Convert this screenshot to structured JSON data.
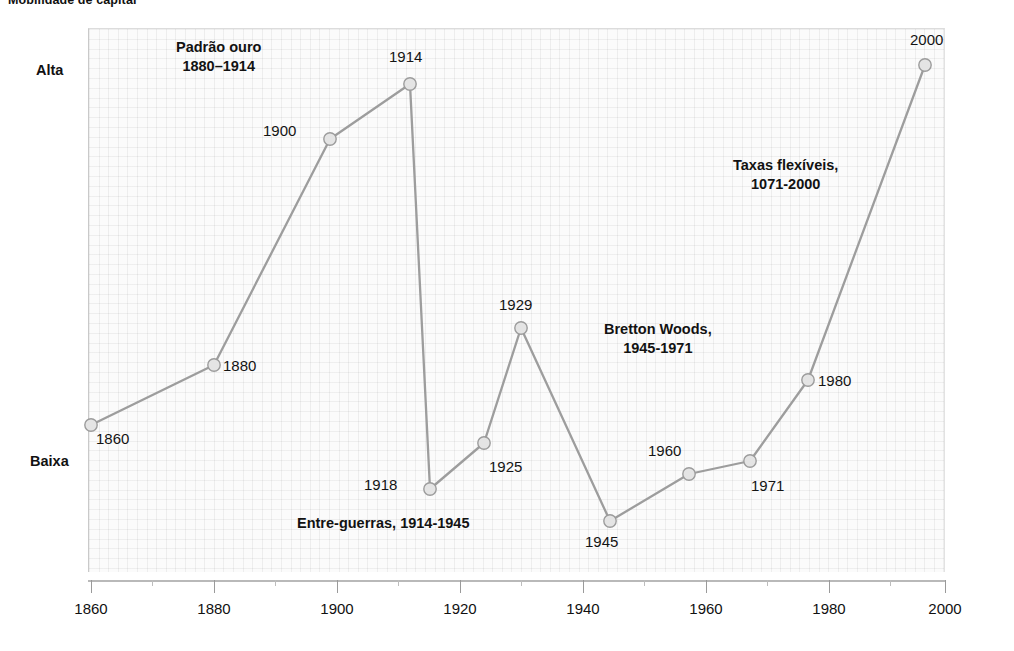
{
  "title": "Mobilidade de capital",
  "axes": {
    "y_labels": [
      {
        "name": "alta",
        "text": "Alta"
      },
      {
        "name": "baixa",
        "text": "Baixa"
      }
    ],
    "x_ticks": [
      "1860",
      "1880",
      "1900",
      "1920",
      "1940",
      "1960",
      "1980",
      "2000"
    ]
  },
  "annotations": [
    {
      "name": "gold-standard",
      "line1": "Padrão ouro",
      "line2": "1880–1914"
    },
    {
      "name": "interwar",
      "line1": "Entre-guerras, 1914-1945",
      "line2": ""
    },
    {
      "name": "bretton-woods",
      "line1": "Bretton Woods,",
      "line2": "1945-1971"
    },
    {
      "name": "flexible-rates",
      "line1": "Taxas flexíveis,",
      "line2": "1071-2000"
    }
  ],
  "point_labels": [
    "1860",
    "1880",
    "1900",
    "1914",
    "1918",
    "1925",
    "1929",
    "1945",
    "1960",
    "1971",
    "1980",
    "2000"
  ],
  "colors": {
    "line": "#9a9a9a",
    "marker_fill": "#e3e3e3",
    "marker_stroke": "#9c9c9c",
    "grid": "#ececec",
    "text": "#141414",
    "axis": "#b9b9b9"
  },
  "chart_data": {
    "type": "line",
    "title": "Mobilidade de capital",
    "xlabel": "",
    "ylabel": "Mobilidade de capital",
    "xlim": [
      1855,
      2005
    ],
    "ylim": [
      0,
      1
    ],
    "grid": true,
    "legend": "none",
    "ytick_labels": [
      "Baixa",
      "Alta"
    ],
    "ytick_values": [
      0.2,
      0.92
    ],
    "xtick_values": [
      1860,
      1880,
      1900,
      1920,
      1940,
      1960,
      1980,
      2000
    ],
    "x": [
      1860,
      1880,
      1900,
      1914,
      1918,
      1925,
      1929,
      1945,
      1960,
      1971,
      1980,
      2000
    ],
    "y": [
      0.27,
      0.38,
      0.8,
      0.9,
      0.16,
      0.24,
      0.45,
      0.1,
      0.18,
      0.21,
      0.35,
      0.93
    ],
    "point_labels": [
      "1860",
      "1880",
      "1900",
      "1914",
      "1918",
      "1925",
      "1929",
      "1945",
      "1960",
      "1971",
      "1980",
      "2000"
    ],
    "annotations": [
      {
        "text": "Padrão ouro 1880–1914",
        "x": 1896,
        "y": 0.97
      },
      {
        "text": "Entre-guerras, 1914-1945",
        "x": 1925,
        "y": 0.08
      },
      {
        "text": "Bretton Woods, 1945-1971",
        "x": 1957,
        "y": 0.48
      },
      {
        "text": "Taxas flexíveis, 1071-2000",
        "x": 1980,
        "y": 0.76
      }
    ]
  },
  "_geometry": {
    "plot": {
      "x": 88,
      "y": 28,
      "w": 857,
      "h": 544
    },
    "points_px": [
      {
        "label": "1860",
        "cx": 91,
        "cy": 425,
        "lx": 96,
        "ly": 430
      },
      {
        "label": "1880",
        "cx": 214,
        "cy": 365,
        "lx": 223,
        "ly": 357
      },
      {
        "label": "1900",
        "cx": 330,
        "cy": 139,
        "lx": 263,
        "ly": 122
      },
      {
        "label": "1914",
        "cx": 410,
        "cy": 84,
        "lx": 389,
        "ly": 48
      },
      {
        "label": "1918",
        "cx": 430,
        "cy": 489,
        "lx": 364,
        "ly": 476
      },
      {
        "label": "1925",
        "cx": 484,
        "cy": 443,
        "lx": 489,
        "ly": 458
      },
      {
        "label": "1929",
        "cx": 521,
        "cy": 328,
        "lx": 499,
        "ly": 296
      },
      {
        "label": "1945",
        "cx": 610,
        "cy": 521,
        "lx": 585,
        "ly": 533
      },
      {
        "label": "1960",
        "cx": 689,
        "cy": 474,
        "lx": 648,
        "ly": 442
      },
      {
        "label": "1971",
        "cx": 750,
        "cy": 461,
        "lx": 751,
        "ly": 477
      },
      {
        "label": "1980",
        "cx": 808,
        "cy": 380,
        "lx": 818,
        "ly": 372
      },
      {
        "label": "2000",
        "cx": 925,
        "cy": 65,
        "lx": 910,
        "ly": 31
      }
    ],
    "x_major_px": [
      91,
      214,
      337,
      460,
      583,
      706,
      829,
      945
    ],
    "x_minor_px": [
      152,
      275,
      398,
      521,
      644,
      767,
      890
    ]
  }
}
